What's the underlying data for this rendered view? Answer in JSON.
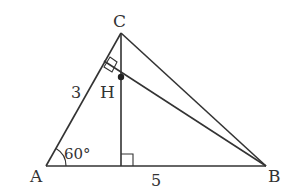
{
  "diagram": {
    "type": "geometry-triangle",
    "points": {
      "A": {
        "label": "A",
        "x": 46,
        "y": 166
      },
      "B": {
        "label": "B",
        "x": 266,
        "y": 166
      },
      "C": {
        "label": "C",
        "x": 121,
        "y": 33
      },
      "H": {
        "label": "H",
        "x": 121,
        "y": 77
      },
      "D": {
        "x": 121,
        "y": 166
      },
      "E": {
        "x": 108,
        "y": 54
      }
    },
    "labels": {
      "A": "A",
      "B": "B",
      "C": "C",
      "H": "H",
      "side_AC": "3",
      "side_AB": "5",
      "angle_A": "60°"
    },
    "segments": [
      "AB",
      "AC",
      "BC",
      "CD",
      "BE"
    ],
    "right_angles": [
      "at foot of altitude from C on AB",
      "at foot of perpendicular from B on AC"
    ],
    "colors": {
      "line": "#333333",
      "background": "#ffffff"
    }
  }
}
